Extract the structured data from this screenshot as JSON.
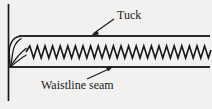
{
  "figure": {
    "name": "tuck-and-waistline-seam-diagram",
    "background_color": "#f2f1ef",
    "ink_color": "#1a1a1a",
    "width": 212,
    "height": 109
  },
  "labels": {
    "tuck": "Tuck",
    "waistline_seam": "Waistline seam"
  },
  "annotations": {
    "tuck_leader": {
      "name": "tuck-leader-arrow",
      "from_x": 114,
      "from_y": 19,
      "to_x": 91,
      "to_y": 35,
      "points_to": "tuck-fold-top-edge"
    },
    "waistline_leader": {
      "name": "waistline-seam-leader-arrow",
      "from_x": 87,
      "from_y": 79,
      "to_x": 113,
      "to_y": 66,
      "points_to": "waistline-seam-line"
    }
  },
  "geometry": {
    "left_rule": {
      "name": "vertical-rule",
      "x": 8,
      "y1": 4,
      "y2": 101
    },
    "tuck_top_edge": {
      "name": "tuck-top-edge-line",
      "x1": 18,
      "y1": 36,
      "x2": 209,
      "y2": 36
    },
    "waistline_seam_line": {
      "name": "waistline-seam-line",
      "x1": 9,
      "y1": 67,
      "x2": 209,
      "y2": 67
    },
    "fold_point": {
      "x": 10,
      "y": 67
    },
    "zigzag": {
      "name": "zigzag-stitch-line",
      "x_start": 26,
      "x_end": 209,
      "center_y": 52,
      "amplitude": 6,
      "period": 7.6,
      "stroke_width": 1.6
    }
  }
}
